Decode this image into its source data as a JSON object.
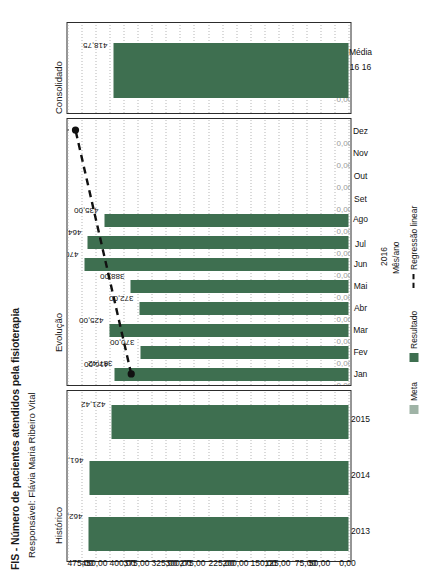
{
  "header": {
    "title": "FIS - Número de pacientes atendidos pela fisioterapia",
    "subtitle": "Responsável: Flávia Maria Ribeiro Vital"
  },
  "panels": {
    "consolidado_label": "Consolidado",
    "evolucao_label": "Evolução",
    "historico_label": "Histórico"
  },
  "axis": {
    "value_title": "",
    "category_title": "Mês/ano",
    "year": "2016",
    "ticks": [
      "0,00",
      "25,00",
      "50,00",
      "75,00",
      "100,00",
      "125,00",
      "150,00",
      "175,00",
      "200,00",
      "225,00",
      "250,00",
      "275,00",
      "300,00",
      "325,00",
      "350,00",
      "375,00",
      "400,00",
      "425,00",
      "450,00",
      "475,00"
    ],
    "ticks_visible": [
      "0,00",
      "50,00",
      "75,00",
      "125,00",
      "150,00",
      "200,00",
      "225,00",
      "275,00",
      "300,00",
      "325,00",
      "375,00",
      "400,00",
      "450,00",
      "475,00"
    ]
  },
  "legend": {
    "meta": "Meta",
    "resultado": "Resultado",
    "regressao": "Regressão linear"
  },
  "consolidado_axis_rows": {
    "top": "16  16",
    "bottom": "Média"
  },
  "chart_data": {
    "type": "bar",
    "title": "FIS - Número de pacientes atendidos pela fisioterapia",
    "subtitle": "Responsável: Flávia Maria Ribeiro Vital",
    "orientation": "horizontal",
    "xlabel": "Mês/ano",
    "ylabel": "",
    "xlim": [
      0,
      500
    ],
    "grid": true,
    "legend_position": "bottom",
    "panels": [
      {
        "name": "Histórico",
        "categories": [
          "2013",
          "2014",
          "2015"
        ],
        "series": [
          {
            "name": "Resultado",
            "values": [
              462.92,
              461.17,
              421.42
            ],
            "labels": [
              "462,92",
              "461,17",
              "421,42"
            ],
            "color": "#3e6f50"
          }
        ]
      },
      {
        "name": "Evolução",
        "categories": [
          "Jan",
          "Fev",
          "Mar",
          "Abr",
          "Mai",
          "Jun",
          "Jul",
          "Ago",
          "Set",
          "Out",
          "Nov",
          "Dez"
        ],
        "series": [
          {
            "name": "Resultado",
            "values": [
              416.0,
              370.0,
              425.0,
              372.0,
              388.0,
              470.0,
              464.0,
              435.0,
              null,
              null,
              null,
              null
            ],
            "labels": [
              "416,00",
              "370,00",
              "425,00",
              "372,00",
              "388,00",
              "470,00",
              "464,00",
              "435,00",
              "",
              "",
              "",
              ""
            ],
            "color": "#3e6f50"
          },
          {
            "name": "Meta",
            "values": [
              0,
              0,
              0,
              0,
              0,
              0,
              0,
              0,
              0,
              0,
              0,
              0
            ],
            "labels": [
              "0,00",
              "0,00",
              "0,00",
              "0,00",
              "0,00",
              "0,00",
              "0,00",
              "0,00",
              "0,00",
              "0,00",
              "0,00",
              "0,00"
            ],
            "color": "#9fb3a6"
          },
          {
            "name": "Regressão linear",
            "type": "line",
            "style": "dashed",
            "endpoints": [
              {
                "category": "Jan",
                "value": 387.42,
                "label": "387,42"
              },
              {
                "category": "Dez",
                "value": 485.89,
                "label": "485,89"
              }
            ]
          }
        ]
      },
      {
        "name": "Consolidado",
        "categories": [
          "Média"
        ],
        "series": [
          {
            "name": "Resultado",
            "values": [
              418.75
            ],
            "labels": [
              "418,75"
            ],
            "color": "#3e6f50"
          },
          {
            "name": "Meta",
            "values": [
              0
            ],
            "labels": [
              "0,00"
            ],
            "color": "#9fb3a6"
          }
        ]
      }
    ]
  }
}
